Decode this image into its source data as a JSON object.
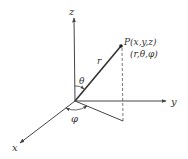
{
  "diagram": {
    "axes": {
      "x": {
        "label": "x"
      },
      "y": {
        "label": "y"
      },
      "z": {
        "label": "z"
      }
    },
    "point": {
      "cartesian_label": "P(x,y,z)",
      "spherical_label": "(r,θ,φ)"
    },
    "radius_label": "r",
    "polar_angle_label": "θ",
    "azimuth_angle_label": "φ",
    "colors": {
      "line": "#444444",
      "text": "#333333",
      "background": "#ffffff"
    }
  }
}
